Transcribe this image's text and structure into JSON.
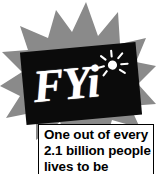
{
  "graphic": {
    "kind": "fyi-fact-callout",
    "logo": {
      "wordmark": "FYi",
      "icon_name": "sunburst-icon",
      "badge_color": "#0b0b0b",
      "wordmark_color": "#ffffff"
    },
    "starburst": {
      "name": "starburst-badge",
      "color": "#8a8a8a",
      "points": 12
    },
    "caption": {
      "border_color": "#000000",
      "background_color": "#ffffff",
      "text_color": "#000000",
      "lines": [
        "One out of every",
        "2.1 billion people",
        "lives to be"
      ],
      "full_text": "One out of every 2.1 billion people lives to be"
    },
    "stat": {
      "value": "2.1",
      "unit": "billion",
      "noun": "people"
    }
  }
}
